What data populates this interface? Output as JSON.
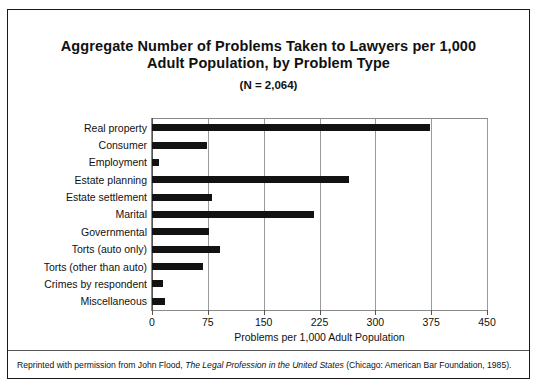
{
  "figure": {
    "title_line1": "Aggregate Number of Problems Taken to Lawyers per 1,000",
    "title_line2": "Adult Population, by Problem Type",
    "subtitle": "(N = 2,064)",
    "caption_prefix": "Reprinted with permission from John Flood, ",
    "caption_italic": "The Legal Profession in the United States",
    "caption_suffix": " (Chicago: American Bar Foundation, 1985).",
    "bar_color": "#121212",
    "grid_color": "#9a9a9a",
    "frame_color": "#1a1a1a"
  },
  "chart_data": {
    "type": "bar",
    "orientation": "horizontal",
    "title": "Aggregate Number of Problems Taken to Lawyers per 1,000 Adult Population, by Problem Type",
    "subtitle": "(N = 2,064)",
    "xlabel": "Problems per 1,000 Adult Population",
    "ylabel": "",
    "xlim": [
      0,
      450
    ],
    "xticks": [
      0,
      75,
      150,
      225,
      300,
      375,
      450
    ],
    "grid": "vertical",
    "legend": "none",
    "categories": [
      "Real property",
      "Consumer",
      "Employment",
      "Estate planning",
      "Estate settlement",
      "Marital",
      "Governmental",
      "Torts (auto only)",
      "Torts (other than auto)",
      "Crimes by respondent",
      "Miscellaneous"
    ],
    "values": [
      374,
      74,
      10,
      264,
      80,
      217,
      76,
      91,
      68,
      15,
      18
    ]
  }
}
